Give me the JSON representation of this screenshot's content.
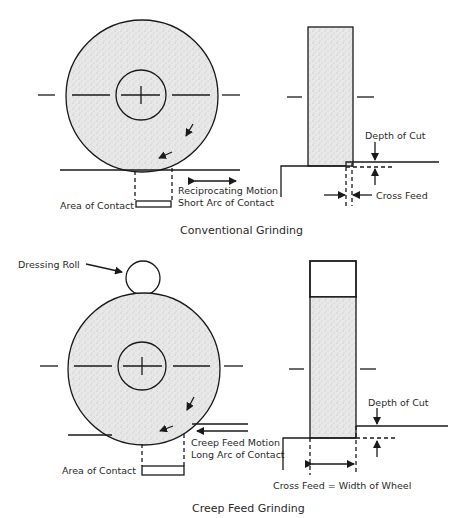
{
  "page_corner": "(   )",
  "conventional": {
    "caption": "Conventional Grinding",
    "labels": {
      "depth_of_cut": "Depth of Cut",
      "cross_feed": "Cross Feed",
      "motion_line1": "Reciprocating Motion",
      "motion_line2": "Short Arc of Contact",
      "area_of_contact": "Area of Contact"
    }
  },
  "creep_feed": {
    "caption": "Creep Feed Grinding",
    "labels": {
      "dressing_roll": "Dressing Roll",
      "depth_of_cut": "Depth of Cut",
      "cross_feed": "Cross Feed = Width of Wheel",
      "motion_line1": "Creep Feed Motion",
      "motion_line2": "Long Arc of Contact",
      "area_of_contact": "Area of Contact"
    }
  },
  "colors": {
    "line": "#1a1a1a",
    "wheel_fill": "#e6e6e6"
  }
}
